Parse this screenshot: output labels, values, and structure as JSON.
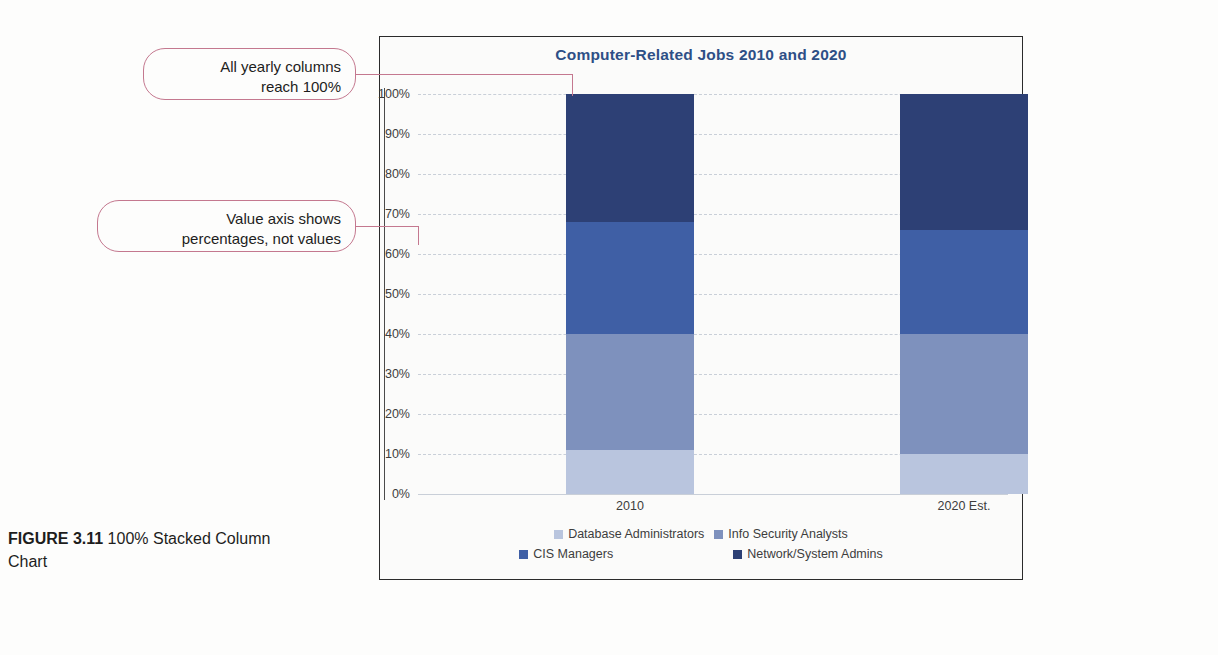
{
  "figure": {
    "label": "FIGURE 3.11",
    "caption": "100% Stacked Column Chart"
  },
  "callouts": [
    {
      "id": "callout-1",
      "line1": "All yearly columns",
      "line2": "reach 100%"
    },
    {
      "id": "callout-2",
      "line1": "Value axis shows",
      "line2": "percentages, not values"
    }
  ],
  "colors": {
    "database_administrators": "#b9c5de",
    "info_security_analysts": "#7e91bd",
    "cis_managers": "#3f5fa5",
    "network_system_admins": "#2d4075",
    "title": "#2e4f86",
    "callout_border": "#c4788f",
    "gridline": "#c9cfd8",
    "panel_border": "#2b2b2b"
  },
  "chart_data": {
    "type": "bar",
    "stacked": true,
    "normalized_100": true,
    "title": "Computer-Related Jobs 2010 and 2020",
    "xlabel": "",
    "ylabel": "",
    "categories": [
      "2010",
      "2020 Est."
    ],
    "ylim": [
      0,
      100
    ],
    "ytick_labels": [
      "0%",
      "10%",
      "20%",
      "30%",
      "40%",
      "50%",
      "60%",
      "70%",
      "80%",
      "90%",
      "100%"
    ],
    "ytick_values": [
      0,
      10,
      20,
      30,
      40,
      50,
      60,
      70,
      80,
      90,
      100
    ],
    "grid": true,
    "legend_position": "bottom",
    "series": [
      {
        "name": "Database Administrators",
        "color": "#b9c5de",
        "values": [
          11,
          10
        ]
      },
      {
        "name": "Info Security Analysts",
        "color": "#7e91bd",
        "values": [
          29,
          30
        ]
      },
      {
        "name": "CIS Managers",
        "color": "#3f5fa5",
        "values": [
          28,
          26
        ]
      },
      {
        "name": "Network/System Admins",
        "color": "#2d4075",
        "values": [
          32,
          34
        ]
      }
    ],
    "cumulative_tops": {
      "2010": [
        11,
        40,
        68,
        100
      ],
      "2020 Est.": [
        10,
        40,
        66,
        100
      ]
    }
  }
}
